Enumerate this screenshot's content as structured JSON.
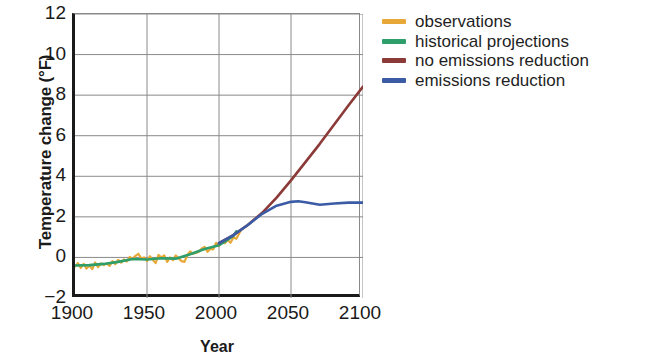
{
  "chart_data": {
    "type": "line",
    "title": "",
    "xlabel": "Year",
    "ylabel": "Temperature change (°F)",
    "xlim": [
      1900,
      2100
    ],
    "ylim": [
      -2,
      12
    ],
    "xticks": [
      1900,
      1950,
      2000,
      2050,
      2100
    ],
    "xtick_labels": [
      "1900",
      "1950",
      "2000",
      "2050",
      "2100"
    ],
    "yticks": [
      -2,
      0,
      2,
      4,
      6,
      8,
      10,
      12
    ],
    "ytick_labels": [
      "−2",
      "0",
      "2",
      "4",
      "6",
      "8",
      "10",
      "12"
    ],
    "grid": true,
    "grid_axis": "both",
    "legend_position": "right-top",
    "series": [
      {
        "name": "observations",
        "color": "#E8A838",
        "x": [
          1900,
          1902,
          1904,
          1906,
          1908,
          1910,
          1912,
          1914,
          1916,
          1918,
          1920,
          1922,
          1924,
          1926,
          1928,
          1930,
          1932,
          1934,
          1936,
          1938,
          1940,
          1942,
          1944,
          1946,
          1948,
          1950,
          1952,
          1954,
          1956,
          1958,
          1960,
          1962,
          1964,
          1966,
          1968,
          1970,
          1972,
          1974,
          1976,
          1978,
          1980,
          1982,
          1984,
          1986,
          1988,
          1990,
          1992,
          1994,
          1996,
          1998,
          2000,
          2002,
          2004,
          2006,
          2008,
          2010,
          2012,
          2014,
          2015
        ],
        "values": [
          -0.45,
          -0.28,
          -0.52,
          -0.32,
          -0.55,
          -0.4,
          -0.58,
          -0.25,
          -0.48,
          -0.3,
          -0.38,
          -0.3,
          -0.42,
          -0.18,
          -0.33,
          -0.12,
          -0.26,
          -0.1,
          -0.2,
          0.02,
          -0.08,
          0.08,
          0.18,
          -0.05,
          0.0,
          -0.18,
          0.06,
          -0.12,
          -0.28,
          0.12,
          0.0,
          0.1,
          -0.22,
          0.0,
          -0.14,
          0.1,
          -0.05,
          -0.18,
          -0.22,
          0.12,
          0.3,
          0.18,
          0.22,
          0.28,
          0.44,
          0.52,
          0.28,
          0.42,
          0.4,
          0.72,
          0.56,
          0.78,
          0.7,
          0.86,
          0.72,
          0.98,
          0.92,
          1.18,
          1.32
        ]
      },
      {
        "name": "historical projections",
        "color": "#2E9E6B",
        "x": [
          1900,
          1910,
          1920,
          1930,
          1940,
          1950,
          1960,
          1970,
          1980,
          1990,
          2000,
          2005,
          2010,
          2012
        ],
        "values": [
          -0.4,
          -0.38,
          -0.32,
          -0.22,
          -0.08,
          -0.1,
          -0.04,
          -0.06,
          0.16,
          0.42,
          0.6,
          0.82,
          1.06,
          1.28
        ]
      },
      {
        "name": "no emissions reduction",
        "color": "#8B3A38",
        "x": [
          2000,
          2010,
          2020,
          2030,
          2040,
          2050,
          2060,
          2070,
          2080,
          2090,
          2100
        ],
        "values": [
          0.7,
          1.1,
          1.6,
          2.2,
          2.95,
          3.8,
          4.7,
          5.6,
          6.55,
          7.5,
          8.42
        ]
      },
      {
        "name": "emissions reduction",
        "color": "#3B5BA5",
        "x": [
          2000,
          2010,
          2020,
          2030,
          2040,
          2050,
          2055,
          2060,
          2070,
          2080,
          2090,
          2100
        ],
        "values": [
          0.7,
          1.1,
          1.6,
          2.15,
          2.55,
          2.74,
          2.77,
          2.72,
          2.6,
          2.66,
          2.7,
          2.7
        ]
      }
    ]
  },
  "legend": {
    "items": [
      {
        "label": "observations",
        "color": "#E8A838"
      },
      {
        "label": "historical projections",
        "color": "#2E9E6B"
      },
      {
        "label": "no emissions reduction",
        "color": "#8B3A38"
      },
      {
        "label": "emissions reduction",
        "color": "#3B5BA5"
      }
    ]
  }
}
